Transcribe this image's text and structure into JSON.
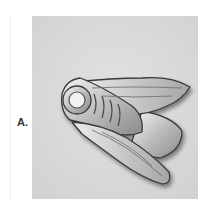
{
  "figure": {
    "label": "A.",
    "background_color": "#dcdcdc",
    "metal_color": "#c8c8c8"
  }
}
